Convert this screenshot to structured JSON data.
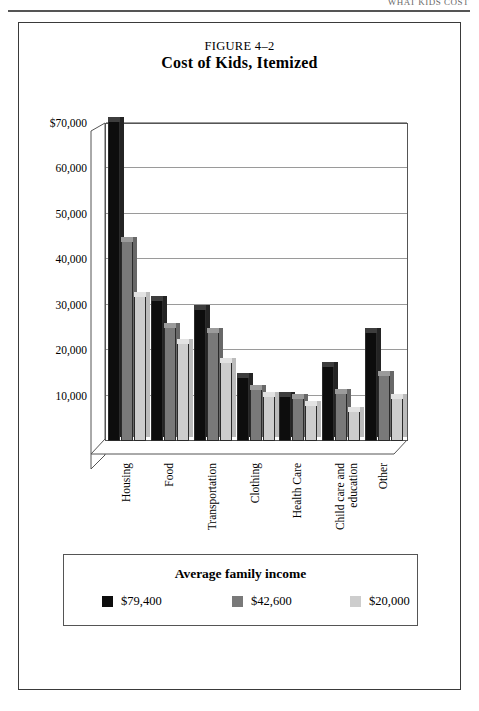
{
  "page": {
    "running_head": "WHAT KIDS COST",
    "rule_color": "#555555"
  },
  "figure": {
    "number_label": "FIGURE 4–2",
    "title": "Cost of Kids, Itemized"
  },
  "chart_data": {
    "type": "bar",
    "title": "Cost of Kids, Itemized",
    "subtitle": "FIGURE 4–2",
    "xlabel": "",
    "ylabel": "",
    "ylim": [
      0,
      70000
    ],
    "grid": true,
    "legend_position": "bottom",
    "legend_title": "Average family income",
    "ytick_labels": [
      "$70,000",
      "60,000",
      "50,000",
      "40,000",
      "30,000",
      "20,000",
      "10,000"
    ],
    "ytick_values": [
      70000,
      60000,
      50000,
      40000,
      30000,
      20000,
      10000
    ],
    "categories": [
      "Housing",
      "Food",
      "Transportation",
      "Clothing",
      "Health Care",
      "Child care and education",
      "Other"
    ],
    "series": [
      {
        "name": "$79,400",
        "color": "#0d0d0d",
        "values": [
          70500,
          31000,
          29000,
          14000,
          10000,
          16500,
          24000
        ]
      },
      {
        "name": "$42,600",
        "color": "#797979",
        "values": [
          44000,
          25000,
          24000,
          11500,
          9500,
          10500,
          14500
        ]
      },
      {
        "name": "$20,000",
        "color": "#cdcdcd",
        "values": [
          32000,
          21500,
          17500,
          10000,
          8000,
          6500,
          9500
        ]
      }
    ]
  },
  "legend": {
    "title": "Average family income",
    "items": [
      {
        "label": "$79,400",
        "color": "#0d0d0d"
      },
      {
        "label": "$42,600",
        "color": "#797979"
      },
      {
        "label": "$20,000",
        "color": "#cdcdcd"
      }
    ]
  }
}
